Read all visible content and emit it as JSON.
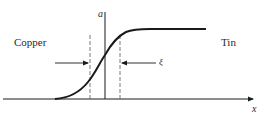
{
  "diagram": {
    "labels": {
      "left_region": "Copper",
      "right_region": "Tin",
      "vertical_axis": "a",
      "horizontal_axis": "x",
      "width_symbol": "ξ"
    },
    "colors": {
      "stroke": "#1a1a1a",
      "dashed": "#555555",
      "text": "#2a2a2a",
      "background": "#ffffff"
    }
  }
}
